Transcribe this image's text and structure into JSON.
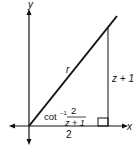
{
  "diagram": {
    "axes": {
      "x_label": "x",
      "y_label": "y"
    },
    "hypotenuse_label": "r",
    "vertical_leg_label": "z + 1",
    "horizontal_leg_label": "2",
    "angle_label": {
      "prefix": "cot",
      "superscript": "−1",
      "numerator": "2",
      "denominator": "z + 1"
    },
    "right_angle_marker": true,
    "colors": {
      "stroke": "#111111",
      "background": "#ffffff"
    }
  }
}
